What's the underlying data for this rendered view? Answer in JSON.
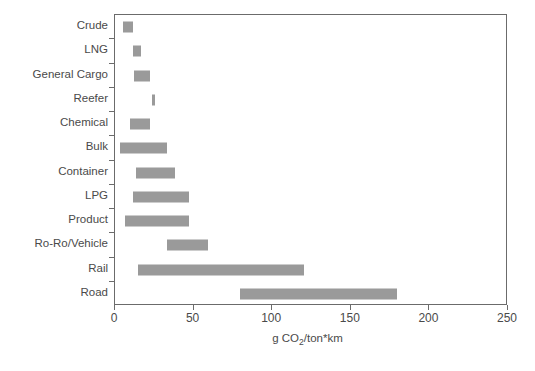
{
  "chart_data": {
    "type": "bar",
    "orientation": "horizontal",
    "title": "",
    "subtitle": "",
    "xlabel": "g CO2/ton*km",
    "xlabel_parts": {
      "pre": "g CO",
      "sub": "2",
      "post": "/ton*km"
    },
    "ylabel": "",
    "xlim": [
      0,
      250
    ],
    "xticks": [
      0,
      50,
      100,
      150,
      200,
      250
    ],
    "xticklabels": [
      "0",
      "50",
      "100",
      "150",
      "200",
      "250"
    ],
    "grid": false,
    "legend": null,
    "bar_color": "#9a9a9a",
    "axis_color": "#6b6b6b",
    "note": "Each bar is a range (floating bar) from low to high value",
    "categories": [
      "Crude",
      "LNG",
      "General Cargo",
      "Reefer",
      "Chemical",
      "Bulk",
      "Container",
      "LPG",
      "Product",
      "Ro-Ro/Vehicle",
      "Rail",
      "Road"
    ],
    "ranges": [
      {
        "category": "Crude",
        "low": 6,
        "high": 12
      },
      {
        "category": "LNG",
        "low": 12,
        "high": 17
      },
      {
        "category": "General Cargo",
        "low": 13,
        "high": 23
      },
      {
        "category": "Reefer",
        "low": 24,
        "high": 26
      },
      {
        "category": "Chemical",
        "low": 10,
        "high": 23
      },
      {
        "category": "Bulk",
        "low": 4,
        "high": 34
      },
      {
        "category": "Container",
        "low": 14,
        "high": 39
      },
      {
        "category": "LPG",
        "low": 12,
        "high": 48
      },
      {
        "category": "Product",
        "low": 7,
        "high": 48
      },
      {
        "category": "Ro-Ro/Vehicle",
        "low": 34,
        "high": 60
      },
      {
        "category": "Rail",
        "low": 15,
        "high": 121
      },
      {
        "category": "Road",
        "low": 80,
        "high": 180
      }
    ]
  }
}
